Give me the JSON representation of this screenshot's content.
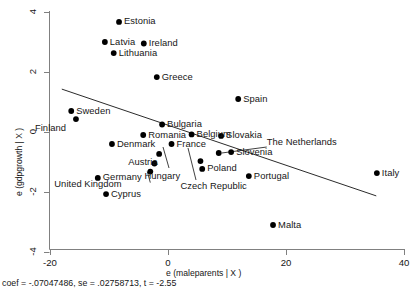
{
  "chart_data": {
    "type": "scatter",
    "title": "",
    "xlabel": "e (maleparents | X )",
    "ylabel": "e (gdpgrowth | X )",
    "xlim": [
      -24.4,
      40.7
    ],
    "ylim": [
      -4.4,
      4.4
    ],
    "xticks": [
      -20,
      0,
      20,
      40
    ],
    "yticks": [
      4,
      2,
      0,
      -2,
      -4
    ],
    "xtick_labels": [
      "-20",
      "0",
      "20",
      "40"
    ],
    "ytick_labels": [
      "4",
      "2",
      "0",
      "-2",
      "-4"
    ],
    "grid": false,
    "legend": "none",
    "caption": "coef = -.07047486, se = .02758713, t = -2.55",
    "fit_line": {
      "type": "linear",
      "slope": -0.07047486,
      "se": 0.02758713,
      "t": -2.55,
      "x_start": -18.0,
      "y_start": 1.43,
      "x_end": 35.3,
      "y_end": -2.13
    },
    "points": [
      {
        "label": "Estonia",
        "x": -8.3,
        "y": 3.67,
        "label_dx": 5,
        "label_dy": -0.5
      },
      {
        "label": "Latvia",
        "x": -10.7,
        "y": 3.0,
        "label_dx": 5,
        "label_dy": -0.5
      },
      {
        "label": "Ireland",
        "x": -4.1,
        "y": 2.95,
        "label_dx": 5,
        "label_dy": -0.5
      },
      {
        "label": "Lithuania",
        "x": -9.2,
        "y": 2.63,
        "label_dx": 5,
        "label_dy": -0.5
      },
      {
        "label": "Greece",
        "x": -1.9,
        "y": 1.83,
        "label_dx": 5,
        "label_dy": -0.5
      },
      {
        "label": "Spain",
        "x": 11.9,
        "y": 1.1,
        "label_dx": 5,
        "label_dy": -0.5
      },
      {
        "label": "Sweden",
        "x": -16.4,
        "y": 0.7,
        "label_dx": 5,
        "label_dy": -0.5
      },
      {
        "label": "Finland",
        "x": -15.6,
        "y": 0.43,
        "label_dx": -41,
        "label_dy": 9
      },
      {
        "label": "Bulgaria",
        "x": -1.0,
        "y": 0.25,
        "label_dx": 5,
        "label_dy": -0.5
      },
      {
        "label": "Romania",
        "x": -4.2,
        "y": -0.1,
        "label_dx": 5,
        "label_dy": -0.5
      },
      {
        "label": "Belgium",
        "x": 4.0,
        "y": -0.08,
        "label_dx": 5,
        "label_dy": -0.5
      },
      {
        "label": "Slovakia",
        "x": 9.0,
        "y": -0.13,
        "label_dx": 5,
        "label_dy": -0.5
      },
      {
        "label": "Denmark",
        "x": -9.5,
        "y": -0.4,
        "label_dx": 5,
        "label_dy": -0.5
      },
      {
        "label": "France",
        "x": 0.6,
        "y": -0.4,
        "label_dx": 5,
        "label_dy": -0.5
      },
      {
        "label": "Austria",
        "x": -1.5,
        "y": -0.73,
        "label_dx": -31,
        "label_dy": 8
      },
      {
        "label": "Slovenia",
        "x": 10.7,
        "y": -0.67,
        "label_dx": 5,
        "label_dy": -0.5
      },
      {
        "label": "Hungary",
        "x": -2.3,
        "y": -1.05,
        "label_dx": -10,
        "label_dy": 12
      },
      {
        "label": "Czech Republic",
        "x": 5.5,
        "y": -0.97,
        "label_dx": -20,
        "label_dy": 25
      },
      {
        "label": "Poland",
        "x": 5.8,
        "y": -1.23,
        "label_dx": 5,
        "label_dy": -0.5
      },
      {
        "label": "Germany",
        "x": -11.9,
        "y": -1.53,
        "label_dx": 5,
        "label_dy": -0.5
      },
      {
        "label": "Portugal",
        "x": 13.7,
        "y": -1.47,
        "label_dx": 5,
        "label_dy": -0.5
      },
      {
        "label": "Italy",
        "x": 35.4,
        "y": -1.37,
        "label_dx": 5,
        "label_dy": -0.5
      },
      {
        "label": "Cyprus",
        "x": -10.5,
        "y": -2.07,
        "label_dx": 5,
        "label_dy": -0.5
      },
      {
        "label": "Malta",
        "x": 17.8,
        "y": -3.1,
        "label_dx": 5,
        "label_dy": -0.5
      },
      {
        "label": "United Kingdom",
        "x": -3.0,
        "y": -1.32,
        "label_dx": -96,
        "label_dy": 12,
        "leader": true
      },
      {
        "label": "The Netherlands",
        "x": 8.6,
        "y": -0.7,
        "label_dx": 48,
        "label_dy": -11,
        "leader": true
      }
    ]
  },
  "axes": {
    "x_title": "e (maleparents | X )",
    "y_title": "e (gdpgrowth | X )"
  },
  "footer": {
    "stats": "coef = -.07047486, se = .02758713, t = -2.55"
  }
}
